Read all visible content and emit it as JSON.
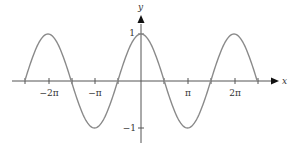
{
  "chart_data": {
    "type": "line",
    "title": "",
    "function": "y = cos(x)",
    "xlabel": "x",
    "ylabel": "y",
    "xlim": [
      -7.854,
      7.854
    ],
    "ylim": [
      -1,
      1
    ],
    "grid": false,
    "legend": null,
    "x_ticks": [
      {
        "value": -7.854,
        "label": ""
      },
      {
        "value": -6.283,
        "label": "−2π"
      },
      {
        "value": -4.712,
        "label": ""
      },
      {
        "value": -3.142,
        "label": "−π"
      },
      {
        "value": -1.571,
        "label": ""
      },
      {
        "value": 1.571,
        "label": ""
      },
      {
        "value": 3.142,
        "label": "π"
      },
      {
        "value": 4.712,
        "label": ""
      },
      {
        "value": 6.283,
        "label": "2π"
      },
      {
        "value": 7.854,
        "label": ""
      }
    ],
    "y_ticks": [
      {
        "value": 1,
        "label": "1"
      },
      {
        "value": -1,
        "label": "−1"
      }
    ],
    "series": [
      {
        "name": "cos(x)",
        "color": "#8a8a8a",
        "x": [
          -7.854,
          -6.283,
          -4.712,
          -3.142,
          -1.571,
          0,
          1.571,
          3.142,
          4.712,
          6.283,
          7.854
        ],
        "y": [
          0,
          1,
          0,
          -1,
          0,
          1,
          0,
          -1,
          0,
          1,
          0
        ]
      }
    ]
  },
  "labels": {
    "x_axis": "x",
    "y_axis": "y",
    "tick_neg_2pi": "−2π",
    "tick_neg_pi": "−π",
    "tick_pi": "π",
    "tick_2pi": "2π",
    "tick_y_1": "1",
    "tick_y_neg1": "−1"
  },
  "colors": {
    "curve": "#8a8a8a",
    "axis": "#555555",
    "text": "#333333"
  }
}
